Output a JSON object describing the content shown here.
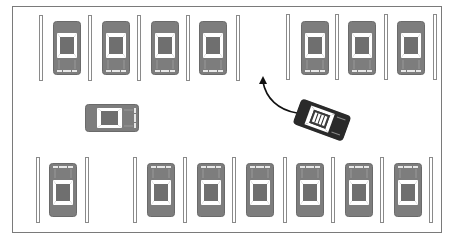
{
  "diagram": {
    "title": "",
    "colors": {
      "background": "#ffffff",
      "border": "#7a7a7a",
      "parked_car_body": "#7d7d7d",
      "parked_car_glass": "#6a6a6a",
      "moving_car_body": "#2a2a2a",
      "stripe_outline": "#8a8a8a",
      "arrow": "#111111"
    },
    "top_row": {
      "stripes_x": [
        41,
        90,
        139,
        188,
        237,
        288,
        337,
        386,
        435
      ],
      "slots": [
        {
          "occupied": true,
          "orientation": "up"
        },
        {
          "occupied": true,
          "orientation": "up"
        },
        {
          "occupied": true,
          "orientation": "up"
        },
        {
          "occupied": true,
          "orientation": "up"
        },
        {
          "occupied": false,
          "orientation": "none"
        },
        {
          "occupied": true,
          "orientation": "up"
        },
        {
          "occupied": true,
          "orientation": "up"
        },
        {
          "occupied": true,
          "orientation": "up"
        }
      ]
    },
    "bottom_row": {
      "stripes_x": [
        38,
        87,
        135,
        185,
        234,
        284,
        333,
        382,
        431
      ],
      "slots": [
        {
          "occupied": true,
          "orientation": "down"
        },
        {
          "occupied": false,
          "orientation": "none"
        },
        {
          "occupied": true,
          "orientation": "down"
        },
        {
          "occupied": true,
          "orientation": "down"
        },
        {
          "occupied": true,
          "orientation": "down"
        },
        {
          "occupied": true,
          "orientation": "down"
        },
        {
          "occupied": true,
          "orientation": "down"
        },
        {
          "occupied": true,
          "orientation": "down"
        }
      ]
    },
    "aisle_car": {
      "orientation": "left",
      "x": 84,
      "y": 106
    },
    "moving_car": {
      "x": 295,
      "y": 102,
      "rotation_deg": 20,
      "label": "maneuvering car"
    },
    "arrow": {
      "from": [
        295,
        112
      ],
      "to": [
        263,
        77
      ],
      "meaning": "path into empty top-row slot"
    }
  }
}
